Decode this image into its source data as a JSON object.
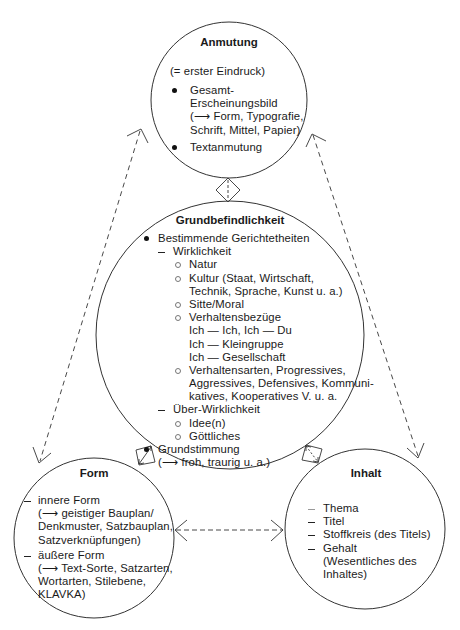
{
  "anmutung": {
    "title": "Anmutung",
    "subtitle": "(= erster Eindruck)",
    "items": [
      {
        "lines": [
          "Gesamt-",
          "Erscheinungsbild",
          "(⟶ Form, Typografie,",
          "Schrift, Mittel, Papier)"
        ]
      },
      {
        "lines": [
          "Textanmutung"
        ]
      }
    ]
  },
  "grundbefindlichkeit": {
    "title": "Grundbefindlichkeit",
    "bullet1": "Bestimmende Gerichtetheiten",
    "wirklichkeit": "Wirklichkeit",
    "natur": "Natur",
    "kultur": [
      "Kultur (Staat, Wirtschaft,",
      "Technik, Sprache, Kunst u. a.)"
    ],
    "sitte": "Sitte/Moral",
    "verhaltensbezuege": "Verhaltensbezüge",
    "bezuege": [
      "Ich — Ich, Ich — Du",
      "Ich — Kleingruppe",
      "Ich — Gesellschaft"
    ],
    "verhaltensarten": [
      "Verhaltensarten, Progressives,",
      "Aggressives, Defensives, Kommuni-",
      "katives, Kooperatives V. u. a."
    ],
    "ueber_wirklichkeit": "Über-Wirklichkeit",
    "idee": "Idee(n)",
    "goettliches": "Göttliches",
    "bullet2": [
      "Grundstimmung",
      "(⟶ froh, traurig u. a.)"
    ]
  },
  "form": {
    "title": "Form",
    "innere": [
      "innere Form",
      "(⟶ geistiger Bauplan/",
      "Denkmuster, Satzbauplan,",
      "Satzverknüpfungen)"
    ],
    "aeussere": [
      "äußere Form",
      "(⟶ Text-Sorte, Satzarten,",
      "Wortarten, Stilebene,",
      "KLAVKA)"
    ]
  },
  "inhalt": {
    "title": "Inhalt",
    "items": [
      {
        "lines": [
          "Thema"
        ]
      },
      {
        "lines": [
          "Titel"
        ]
      },
      {
        "lines": [
          "Stoffkreis (des Titels)"
        ]
      },
      {
        "lines": [
          "Gehalt",
          "(Wesentliches des",
          "Inhaltes)"
        ]
      }
    ]
  },
  "colors": {
    "line": "#333333",
    "text": "#1a1a1a",
    "background": "#ffffff"
  }
}
